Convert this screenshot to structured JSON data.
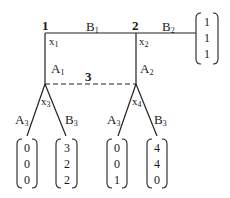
{
  "nodes": [
    {
      "id": "1",
      "label": "1",
      "var": "x",
      "var_sub": "1"
    },
    {
      "id": "2",
      "label": "2",
      "var": "x",
      "var_sub": "2"
    },
    {
      "id": "3",
      "label": "3"
    }
  ],
  "leaf_vars": [
    {
      "var": "x",
      "var_sub": "3"
    },
    {
      "var": "x",
      "var_sub": "4"
    }
  ],
  "edges": {
    "B1": {
      "main": "B",
      "sub": "1"
    },
    "B2": {
      "main": "B",
      "sub": "2"
    },
    "A1": {
      "main": "A",
      "sub": "1"
    },
    "A2": {
      "main": "A",
      "sub": "2"
    },
    "A3_left": {
      "main": "A",
      "sub": "3"
    },
    "B3_left": {
      "main": "B",
      "sub": "3"
    },
    "A3_right": {
      "main": "A",
      "sub": "3"
    },
    "B3_right": {
      "main": "B",
      "sub": "3"
    }
  },
  "payoffs": {
    "right": [
      "1",
      "1",
      "1"
    ],
    "leaf1": [
      "0",
      "0",
      "0"
    ],
    "leaf2": [
      "3",
      "2",
      "2"
    ],
    "leaf3": [
      "0",
      "0",
      "1"
    ],
    "leaf4": [
      "4",
      "4",
      "0"
    ]
  }
}
